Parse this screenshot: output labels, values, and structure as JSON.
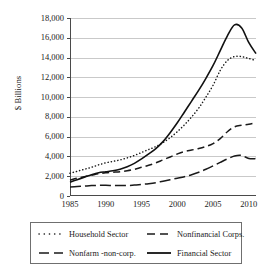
{
  "chart_data": {
    "type": "line",
    "title": "",
    "xlabel": "",
    "ylabel": "$ Billions",
    "xlim": [
      1985,
      2011
    ],
    "ylim": [
      0,
      18000
    ],
    "grid": true,
    "legend_position": "bottom",
    "ytick_labels": [
      "18,000",
      "16,000",
      "14,000",
      "12,000",
      "10,000",
      "8,000",
      "6,000",
      "4,000",
      "2,000",
      "0"
    ],
    "ytick_values": [
      18000,
      16000,
      14000,
      12000,
      10000,
      8000,
      6000,
      4000,
      2000,
      0
    ],
    "xtick_labels": [
      "1985",
      "1990",
      "1995",
      "2000",
      "2005",
      "2010"
    ],
    "xtick_values": [
      1985,
      1990,
      1995,
      2000,
      2005,
      2010
    ],
    "x": [
      1985,
      1986,
      1987,
      1988,
      1989,
      1990,
      1991,
      1992,
      1993,
      1994,
      1995,
      1996,
      1997,
      1998,
      1999,
      2000,
      2001,
      2002,
      2003,
      2004,
      2005,
      2006,
      2007,
      2008,
      2009,
      2010,
      2011
    ],
    "series": [
      {
        "name": "Household Sector",
        "style": "dotted",
        "values": [
          2300,
          2500,
          2700,
          2900,
          3150,
          3350,
          3500,
          3650,
          3850,
          4100,
          4400,
          4700,
          5000,
          5400,
          5900,
          6500,
          7200,
          8000,
          8900,
          10000,
          11200,
          12700,
          13700,
          14100,
          14100,
          13900,
          13700
        ]
      },
      {
        "name": "Nonfinancial Corps.",
        "style": "dashed",
        "values": [
          1600,
          1800,
          1950,
          2100,
          2250,
          2350,
          2400,
          2450,
          2550,
          2700,
          2900,
          3100,
          3350,
          3650,
          3950,
          4250,
          4500,
          4650,
          4800,
          5000,
          5300,
          5800,
          6500,
          7000,
          7150,
          7250,
          7400
        ]
      },
      {
        "name": "Nonfarm -non-corp.",
        "style": "long-dash",
        "values": [
          900,
          950,
          1000,
          1050,
          1080,
          1080,
          1060,
          1050,
          1060,
          1100,
          1180,
          1250,
          1350,
          1500,
          1650,
          1800,
          1950,
          2150,
          2400,
          2700,
          3050,
          3400,
          3750,
          4050,
          4100,
          3800,
          3780
        ]
      },
      {
        "name": "Financial Sector",
        "style": "solid",
        "values": [
          1400,
          1650,
          1900,
          2150,
          2350,
          2450,
          2550,
          2700,
          2950,
          3300,
          3750,
          4250,
          4800,
          5500,
          6400,
          7400,
          8500,
          9600,
          10700,
          11900,
          13200,
          14700,
          16200,
          17300,
          17000,
          15500,
          14400
        ]
      }
    ]
  },
  "legend": {
    "items": [
      {
        "label": "Household Sector",
        "swatch": "dotted-line-swatch"
      },
      {
        "label": "Nonfinancial Corps.",
        "swatch": "dashed-line-swatch"
      },
      {
        "label": "Nonfarm -non-corp.",
        "swatch": "long-dash-line-swatch"
      },
      {
        "label": "Financial Sector",
        "swatch": "solid-line-swatch"
      }
    ]
  }
}
